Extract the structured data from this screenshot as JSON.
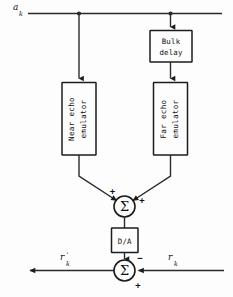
{
  "diagram": {
    "background_color": "#fdfdfd",
    "line_color": "#2a2a2a",
    "signals": {
      "input_top": {
        "base": "a",
        "subscript": "k",
        "prime": ""
      },
      "output_left": {
        "base": "r",
        "subscript": "k",
        "prime": "'"
      },
      "input_right": {
        "base": "r",
        "subscript": "k",
        "prime": ""
      }
    },
    "blocks": [
      {
        "id": "bulk-delay",
        "label_line1": "Bulk",
        "label_line2": "delay",
        "orientation": "horizontal"
      },
      {
        "id": "near-echo-emulator",
        "label_line1": "Near echo",
        "label_line2": "emulator",
        "orientation": "vertical"
      },
      {
        "id": "far-echo-emulator",
        "label_line1": "Far echo",
        "label_line2": "emulator",
        "orientation": "vertical"
      },
      {
        "id": "d-a-converter",
        "label_line1": "D/A",
        "label_line2": "",
        "orientation": "horizontal"
      }
    ],
    "summers": [
      {
        "id": "summer-echo",
        "glyph": "Σ",
        "sign_left": "+",
        "sign_right": "+"
      },
      {
        "id": "summer-output",
        "glyph": "Σ",
        "sign_top": "−",
        "sign_bottom": "+"
      }
    ]
  }
}
